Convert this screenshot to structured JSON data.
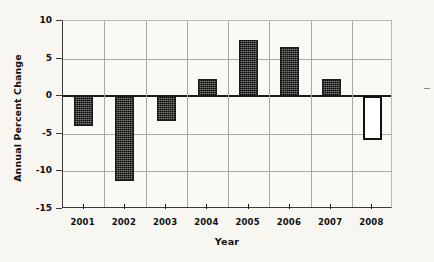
{
  "chart_data": {
    "type": "bar",
    "title": "",
    "xlabel": "Year",
    "ylabel": "Annual Percent Change",
    "categories": [
      "2001",
      "2002",
      "2003",
      "2004",
      "2005",
      "2006",
      "2007",
      "2008"
    ],
    "values": [
      -4.0,
      -11.3,
      -3.3,
      2.3,
      7.5,
      6.5,
      2.3,
      -5.8
    ],
    "series": [
      {
        "name": "Annual Percent Change",
        "values": [
          -4.0,
          -11.3,
          -3.3,
          2.3,
          7.5,
          6.5,
          2.3,
          -5.8
        ]
      }
    ],
    "bar_styles": [
      "filled",
      "filled",
      "filled",
      "filled",
      "filled",
      "filled",
      "filled",
      "open"
    ],
    "ylim": [
      -15,
      10
    ],
    "yticks": [
      10,
      5,
      0,
      -5,
      -10,
      -15
    ],
    "ytick_labels": [
      "10",
      "5",
      "0",
      "-5",
      "-10",
      "-15"
    ],
    "grid": true,
    "grid_axes": "both",
    "legend": null,
    "legend_position": "none",
    "zero_line": 0,
    "colors": {
      "bar_fill": "#55534e",
      "bar_edge": "#1a1a1a",
      "open_bar_fill": "#ffffff",
      "grid": "#a9a8a2",
      "axis": "#3a3a38",
      "text": "#111111",
      "background": "#f7f6f1"
    }
  }
}
